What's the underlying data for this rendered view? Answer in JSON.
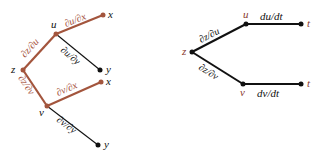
{
  "colors": {
    "highlight": "#a3553d",
    "highlight_text": "#a4503a",
    "normal": "#111111",
    "node_label_accent": "#8a3a30"
  },
  "left_tree": {
    "root": "z",
    "mid_top": "u",
    "mid_bottom": "v",
    "leaf_u_x": "x",
    "leaf_u_y": "y",
    "leaf_v_x": "x",
    "leaf_v_y": "y",
    "edge_z_u": "∂z/∂u",
    "edge_z_v": "∂z/∂v",
    "edge_u_x": "∂u/∂x",
    "edge_u_y": "∂u/∂y",
    "edge_v_x": "∂v/∂x",
    "edge_v_y": "∂v/∂y"
  },
  "right_tree": {
    "root": "z",
    "mid_top": "u",
    "mid_bottom": "v",
    "leaf_top": "t",
    "leaf_bottom": "t",
    "edge_z_u": "∂z/∂u",
    "edge_z_v": "∂z/∂v",
    "edge_u_t": "du/dt",
    "edge_v_t": "dv/dt"
  }
}
